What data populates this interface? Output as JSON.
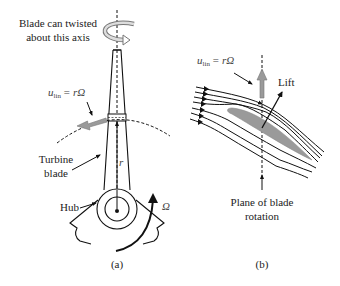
{
  "panel_a": {
    "caption": "(a)",
    "twist_label_line1": "Blade can twisted",
    "twist_label_line2": "about this axis",
    "velocity_label": {
      "u": "u",
      "sub": "lin",
      "eq": "= rΩ"
    },
    "turbine_label_line1": "Turbine",
    "turbine_label_line2": "blade",
    "hub_label": "Hub",
    "radius_label": "r",
    "omega_label": "Ω"
  },
  "panel_b": {
    "caption": "(b)",
    "velocity_label": {
      "u": "u",
      "sub": "lin",
      "eq": "= rΩ"
    },
    "lift_label": "Lift",
    "plane_label_line1": "Plane of blade",
    "plane_label_line2": "rotation"
  },
  "colors": {
    "arrow_fill": "#9a9a9a",
    "airfoil_fill": "#9a9a9a",
    "line": "#111111"
  }
}
